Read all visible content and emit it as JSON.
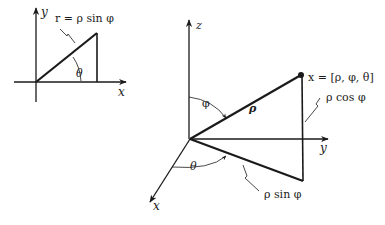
{
  "left_diagram": {
    "axis_x_label": "x",
    "axis_y_label": "y",
    "r_label": "r = ρ sin φ",
    "angle_label": "θ"
  },
  "right_diagram": {
    "axis_x_label": "x",
    "axis_y_label": "y",
    "axis_z_label": "z",
    "point_label": "x = [ρ, φ, θ]",
    "rho_label": "ρ",
    "rho_cos_label": "ρ cos φ",
    "rho_sin_label": "ρ sin φ",
    "phi_label": "φ",
    "theta_label": "θ"
  },
  "colors": {
    "ink": "#1a1a1a",
    "background": "#ffffff"
  }
}
